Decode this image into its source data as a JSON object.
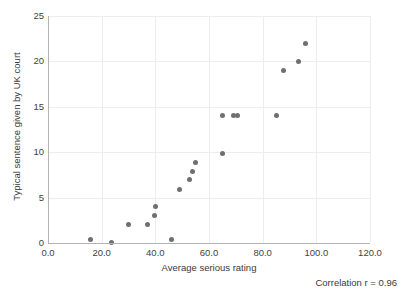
{
  "chart_data": {
    "type": "scatter",
    "title": "",
    "xlabel": "Average serious rating",
    "ylabel": "Typical sentence given by UK court",
    "xlim": [
      0,
      120
    ],
    "ylim": [
      0,
      25
    ],
    "xticks": [
      "0.0",
      "20.0",
      "40.0",
      "60.0",
      "80.0",
      "100.0",
      "120.0"
    ],
    "xtick_values": [
      0,
      20,
      40,
      60,
      80,
      100,
      120
    ],
    "yticks": [
      "0",
      "5",
      "10",
      "15",
      "20",
      "25"
    ],
    "ytick_values": [
      0,
      5,
      10,
      15,
      20,
      25
    ],
    "grid": true,
    "legend": "none",
    "marker_color": "#6f6f6f",
    "gridline_color": "#ededed",
    "axis_color": "#b3b3b3",
    "annotation": "Correlation r = 0.96",
    "points": [
      {
        "x": 16.0,
        "y": 0.4
      },
      {
        "x": 23.5,
        "y": 0.1
      },
      {
        "x": 30.0,
        "y": 2.0
      },
      {
        "x": 37.0,
        "y": 2.0
      },
      {
        "x": 39.8,
        "y": 3.0
      },
      {
        "x": 40.2,
        "y": 4.0
      },
      {
        "x": 46.0,
        "y": 0.4
      },
      {
        "x": 49.0,
        "y": 5.9
      },
      {
        "x": 52.8,
        "y": 7.0
      },
      {
        "x": 54.0,
        "y": 7.9
      },
      {
        "x": 55.0,
        "y": 8.9
      },
      {
        "x": 65.0,
        "y": 9.9
      },
      {
        "x": 65.0,
        "y": 14.0
      },
      {
        "x": 69.0,
        "y": 14.0
      },
      {
        "x": 70.7,
        "y": 14.0
      },
      {
        "x": 85.3,
        "y": 14.0
      },
      {
        "x": 87.8,
        "y": 19.0
      },
      {
        "x": 93.5,
        "y": 20.0
      },
      {
        "x": 96.0,
        "y": 22.0
      }
    ]
  }
}
